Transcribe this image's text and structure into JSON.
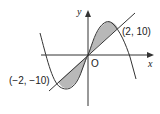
{
  "diagram": {
    "axes": {
      "x_label": "x",
      "y_label": "y",
      "origin_label": "O"
    },
    "points": [
      {
        "label": "(2, 10)",
        "x": 2,
        "y": 10
      },
      {
        "label": "(−2, −10)",
        "x": -2,
        "y": -10
      }
    ],
    "curves": [
      {
        "name": "cubic",
        "description": "cubic curve through origin, local min in third quadrant, local max in first quadrant"
      },
      {
        "name": "line",
        "description": "straight line y = 5x through origin"
      }
    ],
    "shaded_regions": [
      "between line and cubic for -2 ≤ x ≤ 0",
      "between cubic and line for 0 ≤ x ≤ 2"
    ],
    "colors": {
      "shade": "#b8b8b8",
      "stroke": "#333333"
    }
  }
}
